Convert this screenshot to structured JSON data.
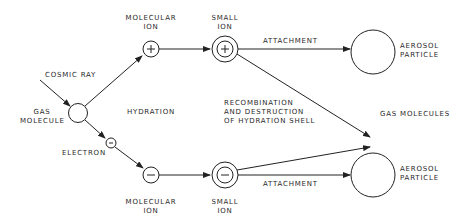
{
  "diagram": {
    "type": "flow",
    "nodes": {
      "gas_molecule": {
        "label_line1": "GAS",
        "label_line2": "MOLECULE"
      },
      "cosmic_ray": {
        "label": "COSMIC RAY"
      },
      "electron": {
        "label": "ELECTRON",
        "symbol": "−"
      },
      "molecular_ion_pos": {
        "label_line1": "MOLECULAR",
        "label_line2": "ION",
        "symbol": "+"
      },
      "molecular_ion_neg": {
        "label_line1": "MOLECULAR",
        "label_line2": "ION",
        "symbol": "−"
      },
      "small_ion_pos": {
        "label_line1": "SMALL",
        "label_line2": "ION",
        "symbol": "+"
      },
      "small_ion_neg": {
        "label_line1": "SMALL",
        "label_line2": "ION",
        "symbol": "−"
      },
      "aerosol_top": {
        "label_line1": "AEROSOL",
        "label_line2": "PARTICLE"
      },
      "aerosol_bottom": {
        "label_line1": "AEROSOL",
        "label_line2": "PARTICLE"
      },
      "gas_molecules": {
        "label": "GAS MOLECULES"
      }
    },
    "edge_labels": {
      "hydration": "HYDRATION",
      "attachment_top": "ATTACHMENT",
      "attachment_bottom": "ATTACHMENT",
      "recombination_line1": "RECOMBINATION",
      "recombination_line2": "AND DESTRUCTION",
      "recombination_line3": "OF HYDRATION SHELL"
    },
    "edges": [
      {
        "from": "cosmic_ray",
        "to": "gas_molecule"
      },
      {
        "from": "gas_molecule",
        "to": "molecular_ion_pos"
      },
      {
        "from": "gas_molecule",
        "to": "electron"
      },
      {
        "from": "electron",
        "to": "molecular_ion_neg"
      },
      {
        "from": "molecular_ion_pos",
        "to": "small_ion_pos"
      },
      {
        "from": "molecular_ion_neg",
        "to": "small_ion_neg"
      },
      {
        "from": "small_ion_pos",
        "to": "aerosol_top",
        "label": "ATTACHMENT"
      },
      {
        "from": "small_ion_neg",
        "to": "aerosol_bottom",
        "label": "ATTACHMENT"
      },
      {
        "from": "small_ion_pos",
        "to": "gas_molecules"
      },
      {
        "from": "small_ion_neg",
        "to": "gas_molecules"
      }
    ],
    "colors": {
      "line": "#222222",
      "background": "#ffffff"
    }
  }
}
